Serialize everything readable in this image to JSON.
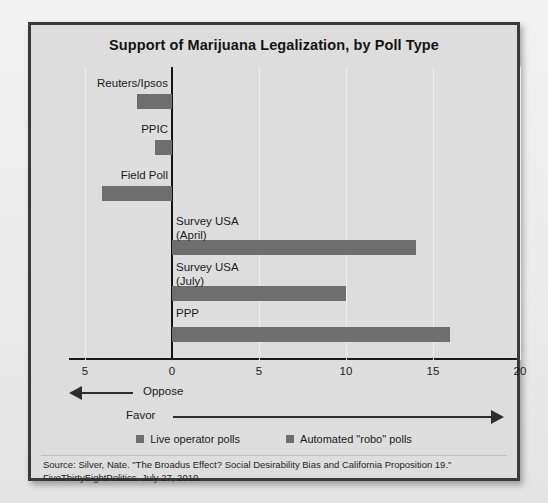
{
  "chart_data": {
    "type": "bar",
    "orientation": "horizontal",
    "title": "Support of Marijuana Legalization, by Poll Type",
    "xlabel": "",
    "ylabel": "",
    "xlim": [
      -5,
      20
    ],
    "xticks": [
      -5,
      0,
      5,
      10,
      15,
      20
    ],
    "xtick_labels": [
      "5",
      "0",
      "5",
      "10",
      "15",
      "20"
    ],
    "grid": true,
    "legend_position": "bottom-center",
    "categories": [
      "Reuters/Ipsos",
      "PPIC",
      "Field Poll",
      "Survey USA\n(April)",
      "Survey USA\n(July)",
      "PPP"
    ],
    "values": [
      -2,
      -1,
      -4,
      14,
      10,
      16
    ],
    "series": [
      {
        "name": "Live operator polls",
        "values": [
          -2,
          -1,
          -4,
          null,
          null,
          null
        ]
      },
      {
        "name": "Automated \"robo\" polls",
        "values": [
          null,
          null,
          null,
          14,
          10,
          16
        ]
      }
    ],
    "legend": [
      "Live operator polls",
      "Automated \"robo\" polls"
    ],
    "annotations": [
      "Oppose",
      "Favor"
    ],
    "bar_color": "#6e6e6e",
    "source": "Source: Silver, Nate. \"The Broadus Effect? Social Desirability Bias and California Proposition 19.\" FiveThirtyEightPolitics. July 27, 2010."
  },
  "axis": {
    "ticks": [
      {
        "label": "5"
      },
      {
        "label": "0"
      },
      {
        "label": "5"
      },
      {
        "label": "10"
      },
      {
        "label": "15"
      },
      {
        "label": "20"
      }
    ]
  },
  "bars": [
    {
      "label": "Reuters/Ipsos",
      "value": -2
    },
    {
      "label": "PPIC",
      "value": -1
    },
    {
      "label": "Field Poll",
      "value": -4
    },
    {
      "label": "Survey USA\n(April)",
      "value": 14
    },
    {
      "label": "Survey USA\n(July)",
      "value": 10
    },
    {
      "label": "PPP",
      "value": 16
    }
  ],
  "arrows": {
    "oppose": "Oppose",
    "favor": "Favor"
  },
  "legend": {
    "items": [
      {
        "label": "Live operator polls",
        "color": "#6e6e6e"
      },
      {
        "label": "Automated \"robo\" polls",
        "color": "#6e6e6e"
      }
    ]
  },
  "source": {
    "line1": "Source: Silver, Nate. \"The Broadus Effect? Social Desirability Bias and California Proposition 19.\"",
    "line2": "FiveThirtyEightPolitics. July 27, 2010."
  },
  "colors": {
    "bar": "#6e6e6e",
    "panel_bg": "#dddddd",
    "frame": "#3a3a3a",
    "axis": "#121212"
  }
}
